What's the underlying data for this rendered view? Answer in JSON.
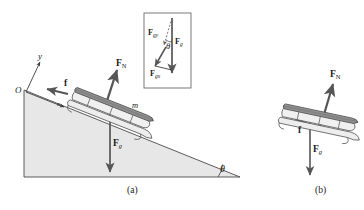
{
  "figure": {
    "caption_a": "(a)",
    "caption_b": "(b)",
    "colors": {
      "incline_fill": "#e7e7e7",
      "incline_stroke": "#4a4a4a",
      "arrow": "#565656",
      "sled_body": "#8a8a8a",
      "sled_light": "#d8d8d8",
      "inset_border": "#6b6b6b",
      "text": "#1a1a1a"
    }
  },
  "panel_a": {
    "name": "sled-on-incline",
    "origin_label": "O",
    "axis_y_label": "y",
    "axis_x_label": "x",
    "mass_label": "m",
    "angle_label": "θ",
    "forces": [
      {
        "key": "normal",
        "symbol": "F",
        "subscript": "N",
        "sub_style": "roman",
        "name": "normal-force"
      },
      {
        "key": "friction",
        "symbol": "f",
        "subscript": "",
        "sub_style": "none",
        "name": "friction-force"
      },
      {
        "key": "gravity",
        "symbol": "F",
        "subscript": "g",
        "sub_style": "italic",
        "name": "gravitational-force"
      }
    ]
  },
  "inset": {
    "name": "force-components-inset",
    "angle_label": "θ",
    "forces": [
      {
        "key": "gravity",
        "symbol": "F",
        "subscript": "g",
        "name": "gravity-vector"
      },
      {
        "key": "gravity_y",
        "symbol": "F",
        "subscript": "gy",
        "name": "gravity-y-component"
      },
      {
        "key": "gravity_x",
        "symbol": "F",
        "subscript": "gx",
        "name": "gravity-x-component"
      }
    ]
  },
  "panel_b": {
    "name": "free-body-diagram",
    "forces": [
      {
        "key": "normal",
        "symbol": "F",
        "subscript": "N",
        "sub_style": "roman",
        "name": "normal-force"
      },
      {
        "key": "friction",
        "symbol": "f",
        "subscript": "",
        "sub_style": "none",
        "name": "friction-force"
      },
      {
        "key": "gravity",
        "symbol": "F",
        "subscript": "g",
        "sub_style": "italic",
        "name": "gravitational-force"
      }
    ]
  }
}
